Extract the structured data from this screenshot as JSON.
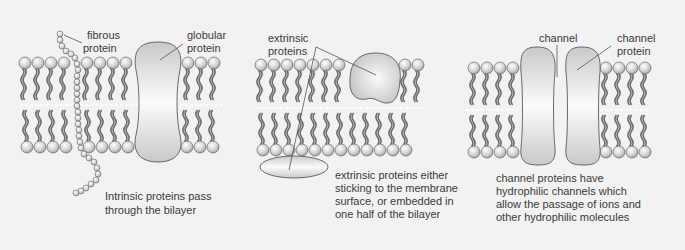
{
  "panels": [
    {
      "id": "intrinsic",
      "labels": {
        "fibrous_line1": "fibrous",
        "fibrous_line2": "protein",
        "globular_line1": "globular",
        "globular_line2": "protein"
      },
      "caption": [
        "Intrinsic proteins pass",
        "through the bilayer"
      ]
    },
    {
      "id": "extrinsic",
      "labels": {
        "extrinsic_line1": "extrinsic",
        "extrinsic_line2": "proteins"
      },
      "caption": [
        "extrinsic proteins either",
        "sticking to the membrane",
        "surface, or embedded in",
        "one half of the bilayer"
      ]
    },
    {
      "id": "channel",
      "labels": {
        "channel": "channel",
        "channel_protein_line1": "channel",
        "channel_protein_line2": "protein"
      },
      "caption": [
        "channel proteins have",
        "hydrophilic channels which",
        "allow the passage of ions and",
        "other hydrophilic molecules"
      ]
    }
  ],
  "colors": {
    "background": "#f2f2f2",
    "head_fill": "#d8d8d8",
    "tail": "#6e6e6e",
    "protein_fill": "#d6d6d6",
    "outline": "#5a5a5a",
    "text": "#3a3a3a"
  }
}
